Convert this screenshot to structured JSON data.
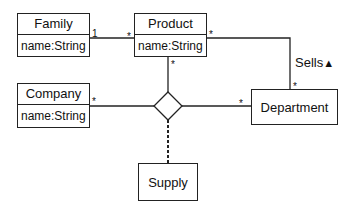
{
  "diagram": {
    "type": "UML class diagram",
    "classes": [
      {
        "name": "Family",
        "attribute": "name:String"
      },
      {
        "name": "Product",
        "attribute": "name:String"
      },
      {
        "name": "Company",
        "attribute": "name:String"
      }
    ],
    "boxes": [
      {
        "name": "Department"
      },
      {
        "name": "Supply"
      }
    ],
    "associations": [
      {
        "from": "Family",
        "to": "Product",
        "from_mult": "1",
        "to_mult": "*"
      },
      {
        "from": "Product",
        "to": "Department",
        "label": "Sells",
        "label_arrow": "▲",
        "from_mult": "*",
        "to_mult": "*"
      },
      {
        "type": "n-ary",
        "hub": "diamond",
        "ends": [
          {
            "class": "Product",
            "mult": "*"
          },
          {
            "class": "Company",
            "mult": "*"
          },
          {
            "class": "Department",
            "mult": "*"
          }
        ],
        "association_class": "Supply"
      }
    ],
    "multiplicities": {
      "family_product_1": "1",
      "family_product_star": "*",
      "product_sells_star": "*",
      "department_sells_star": "*",
      "product_diamond_star": "*",
      "company_diamond_star": "*",
      "department_diamond_star": "*"
    },
    "sells_label": "Sells",
    "sells_arrow": "▲"
  }
}
